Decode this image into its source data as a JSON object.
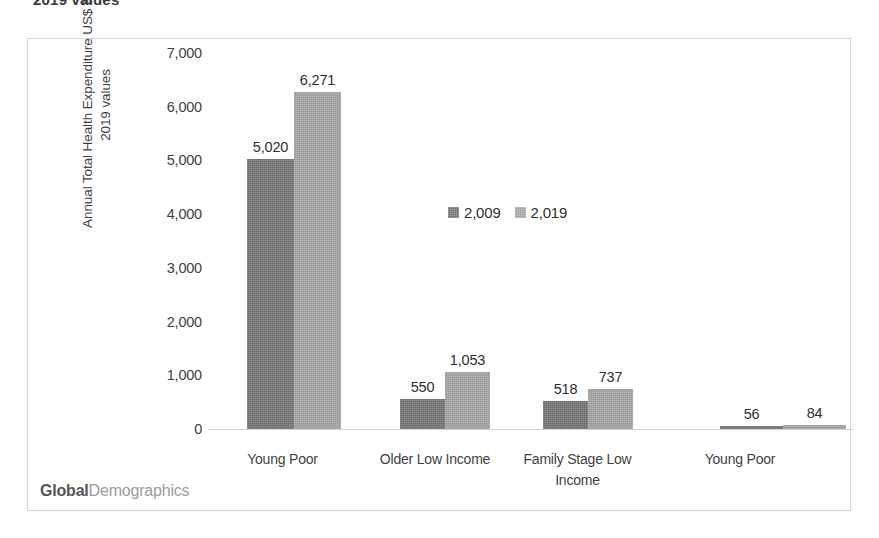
{
  "document": {
    "cropped_title": "2019 values"
  },
  "watermark": {
    "bold_part": "Global",
    "light_part": "Demographics"
  },
  "colors": {
    "series_2009": "#6d6d6d",
    "series_2019": "#9a9a9a",
    "frame_border": "#d6d6d6",
    "axis_line": "#cfcfcf",
    "text": "#3f3f3f"
  },
  "chart_data": {
    "type": "bar",
    "title": "",
    "xlabel": "",
    "ylabel": "Annual Total Health Expenditure US$ Bns 2019 values",
    "ylabel_lines": [
      "Annual Total Health Expenditure US$ Bns",
      "2019 values"
    ],
    "ylim": [
      0,
      7000
    ],
    "yticks": [
      0,
      1000,
      2000,
      3000,
      4000,
      5000,
      6000,
      7000
    ],
    "ytick_labels": [
      "0",
      "1,000",
      "2,000",
      "3,000",
      "4,000",
      "5,000",
      "6,000",
      "7,000"
    ],
    "grid": false,
    "legend_position": "inside-upper-right",
    "categories": [
      "Young Poor",
      "Older Low Income",
      "Family Stage Low Income",
      "Young Poor"
    ],
    "series": [
      {
        "name": "2,009",
        "color": "#6d6d6d",
        "values": [
          5020,
          550,
          518,
          56
        ],
        "labels": [
          "5,020",
          "550",
          "518",
          "56"
        ]
      },
      {
        "name": "2,019",
        "color": "#9a9a9a",
        "values": [
          6271,
          1053,
          737,
          84
        ],
        "labels": [
          "6,271",
          "1,053",
          "737",
          "84"
        ]
      }
    ]
  }
}
